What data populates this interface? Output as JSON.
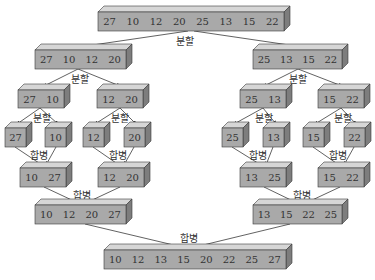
{
  "colors": {
    "box_front": "#a9a9a9",
    "box_top": "#d6d6d6",
    "box_side": "#7d7d7d",
    "line": "#3a3a3a",
    "text": "#333333",
    "background": "#ffffff"
  },
  "labels": {
    "split": "분할",
    "merge": "합병"
  },
  "levels": [
    {
      "name": "input",
      "arrays": [
        {
          "values": [
            "27",
            "10",
            "12",
            "20",
            "25",
            "13",
            "15",
            "22"
          ]
        }
      ]
    },
    {
      "name": "split-1",
      "arrays": [
        {
          "values": [
            "27",
            "10",
            "12",
            "20"
          ]
        },
        {
          "values": [
            "25",
            "13",
            "15",
            "22"
          ]
        }
      ]
    },
    {
      "name": "split-2",
      "arrays": [
        {
          "values": [
            "27",
            "10"
          ]
        },
        {
          "values": [
            "12",
            "20"
          ]
        },
        {
          "values": [
            "25",
            "13"
          ]
        },
        {
          "values": [
            "15",
            "22"
          ]
        }
      ]
    },
    {
      "name": "split-3",
      "arrays": [
        {
          "values": [
            "27"
          ]
        },
        {
          "values": [
            "10"
          ]
        },
        {
          "values": [
            "12"
          ]
        },
        {
          "values": [
            "20"
          ]
        },
        {
          "values": [
            "25"
          ]
        },
        {
          "values": [
            "13"
          ]
        },
        {
          "values": [
            "15"
          ]
        },
        {
          "values": [
            "22"
          ]
        }
      ]
    },
    {
      "name": "merge-1",
      "arrays": [
        {
          "values": [
            "10",
            "27"
          ]
        },
        {
          "values": [
            "12",
            "20"
          ]
        },
        {
          "values": [
            "13",
            "25"
          ]
        },
        {
          "values": [
            "15",
            "22"
          ]
        }
      ]
    },
    {
      "name": "merge-2",
      "arrays": [
        {
          "values": [
            "10",
            "12",
            "20",
            "27"
          ]
        },
        {
          "values": [
            "13",
            "15",
            "22",
            "25"
          ]
        }
      ]
    },
    {
      "name": "output",
      "arrays": [
        {
          "values": [
            "10",
            "12",
            "13",
            "15",
            "20",
            "22",
            "25",
            "27"
          ]
        }
      ]
    }
  ]
}
